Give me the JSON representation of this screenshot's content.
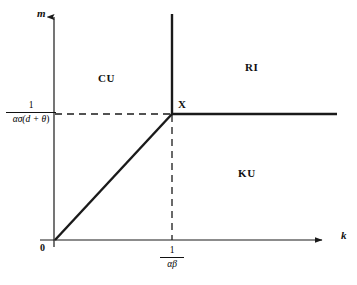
{
  "figure": {
    "type": "phase-diagram",
    "background_color": "#ffffff",
    "line_color": "#1a1a1a",
    "axes": {
      "x": {
        "name": "k",
        "origin_label": "0",
        "ticks": [
          {
            "id": "k-threshold",
            "numerator": "1",
            "denominator": "αβ",
            "text": "1/(αβ)"
          }
        ]
      },
      "y": {
        "name": "m",
        "ticks": [
          {
            "id": "m-threshold",
            "numerator": "1",
            "denominator_prefix": "ασ(",
            "denominator_inner": "d + θ",
            "denominator_suffix": ")",
            "text": "1/(ασ(d+θ))"
          }
        ]
      }
    },
    "regions": [
      {
        "id": "region-cu",
        "label": "CU",
        "position": "upper-left"
      },
      {
        "id": "region-ri",
        "label": "RI",
        "position": "upper-right"
      },
      {
        "id": "region-ku",
        "label": "KU",
        "position": "lower-right"
      }
    ],
    "points": [
      {
        "id": "point-x",
        "label": "X",
        "description": "intersection of boundaries"
      }
    ],
    "curves": [
      {
        "id": "diagonal-boundary",
        "style": "solid",
        "from": "origin",
        "to": "point-x"
      },
      {
        "id": "vertical-boundary",
        "style": "solid",
        "from": "point-x",
        "to": "top"
      },
      {
        "id": "horizontal-boundary",
        "style": "solid",
        "from": "point-x",
        "to": "right"
      },
      {
        "id": "guide-horizontal",
        "style": "dashed",
        "from": "y-axis-tick",
        "to": "point-x"
      },
      {
        "id": "guide-vertical",
        "style": "dashed",
        "from": "point-x",
        "to": "x-axis-tick"
      }
    ]
  }
}
